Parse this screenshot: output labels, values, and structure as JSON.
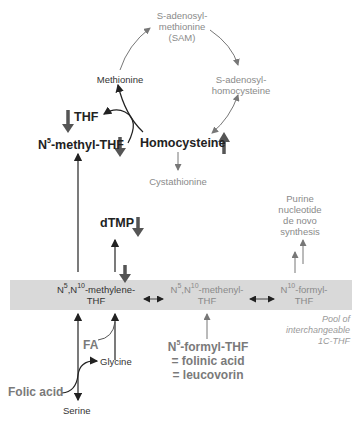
{
  "cycle": {
    "sam": [
      "S-adenosyl-",
      "methionine",
      "(SAM)"
    ],
    "sah": [
      "S-adenosyl-",
      "homocysteine"
    ],
    "methionine": "Methionine",
    "homocysteine": "Homocysteine",
    "cystathionine": "Cystathionine"
  },
  "folate": {
    "thf": "THF",
    "methyl_thf": {
      "n": "N",
      "sup": "5",
      "rest": "-methyl-THF"
    },
    "dtmp": "dTMP",
    "pool": {
      "methylene": {
        "l1a": "N",
        "s1": "5",
        "l1b": ",N",
        "s2": "10",
        "l1c": "-methylene-",
        "l2": "THF"
      },
      "methenyl": {
        "l1a": "N",
        "s1": "5",
        "l1b": ",N",
        "s2": "10",
        "l1c": "-methenyl-",
        "l2": "THF"
      },
      "formyl": {
        "l1a": "N",
        "s1": "10",
        "l1c": "-formyl-",
        "l2": "THF"
      },
      "caption": [
        "Pool of",
        "interchangeable",
        "1C-THF"
      ]
    },
    "purine": [
      "Purine",
      "nucleotide",
      "de novo",
      "synthesis"
    ],
    "formyl_thf": {
      "n": "N",
      "sup": "5",
      "rest": "-formyl-THF",
      "l2": "= folinic acid",
      "l3": "= leucovorin"
    },
    "fa": "FA",
    "glycine": "Glycine",
    "folic_acid": "Folic acid",
    "serine": "Serine"
  },
  "indicators": {
    "thf": "down",
    "methyl_thf": "down",
    "homocysteine": "up",
    "dtmp": "down",
    "methylene_thf": "down"
  },
  "colors": {
    "dark": "#333333",
    "gray": "#8a8a8a",
    "band": "#d9d9d9",
    "bold_arrow": "#555555"
  }
}
